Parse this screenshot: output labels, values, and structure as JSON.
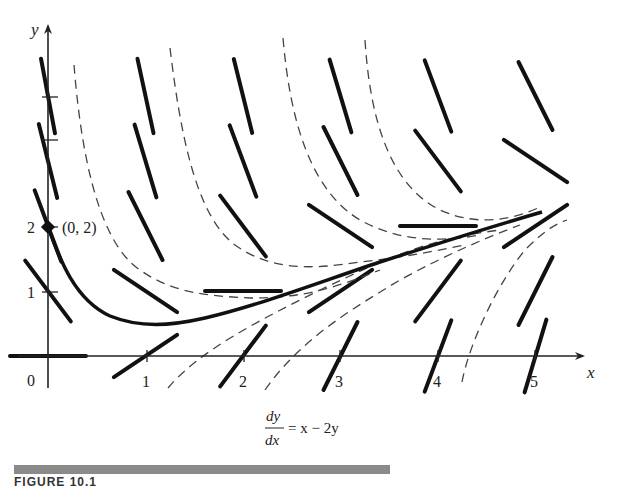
{
  "chart_data": {
    "type": "line",
    "title": "",
    "subtitle": "",
    "equation": {
      "numerator": "dy",
      "denominator": "dx",
      "rhs": "= x − 2y"
    },
    "xlabel": "x",
    "ylabel": "y",
    "origin_label": "0",
    "x_ticks": [
      "1",
      "2",
      "3",
      "4",
      "5"
    ],
    "y_ticks": [
      "1",
      "2"
    ],
    "xlim": [
      0,
      5.5
    ],
    "ylim": [
      -0.4,
      4.9
    ],
    "grid": false,
    "legend": null,
    "annotations": [
      {
        "text": "(0, 2)",
        "x": 0,
        "y": 2,
        "marker": "filled-diamond"
      }
    ],
    "series": [
      {
        "name": "solution through (0, 2)",
        "style": "solid-thick",
        "x": [
          0,
          0.1,
          0.2,
          0.3,
          0.5,
          0.75,
          1.0,
          1.25,
          1.5,
          2.0,
          2.5,
          3.0,
          3.5,
          4.0,
          4.5,
          5.0
        ],
        "y": [
          2.0,
          1.56,
          1.22,
          0.97,
          0.66,
          0.51,
          0.48,
          0.5,
          0.55,
          0.7,
          0.87,
          1.05,
          1.25,
          1.45,
          1.62,
          2.19
        ]
      }
    ],
    "other_solution_curves": [
      {
        "style": "dashed",
        "description": "upper family, steep decreasing then flattening toward slope 1/2 line"
      },
      {
        "style": "dashed",
        "description": "lower family, rising from below x-axis toward asymptote"
      }
    ],
    "slope_field": {
      "equation": "dy/dx = x - 2y",
      "sample_points": [
        [
          0,
          0
        ],
        [
          1,
          0
        ],
        [
          2,
          0
        ],
        [
          3,
          0
        ],
        [
          4,
          0
        ],
        [
          5,
          0
        ],
        [
          0,
          1
        ],
        [
          1,
          1
        ],
        [
          2,
          1
        ],
        [
          3,
          1
        ],
        [
          4,
          1
        ],
        [
          5,
          1
        ],
        [
          0,
          2
        ],
        [
          1,
          2
        ],
        [
          2,
          2
        ],
        [
          3,
          2
        ],
        [
          4,
          2
        ],
        [
          5,
          2
        ],
        [
          0,
          3
        ],
        [
          1,
          3
        ],
        [
          2,
          3
        ],
        [
          3,
          3
        ],
        [
          4,
          3
        ],
        [
          5,
          3
        ],
        [
          0,
          4
        ],
        [
          1,
          4
        ],
        [
          2,
          4
        ],
        [
          3,
          4
        ],
        [
          4,
          4
        ],
        [
          5,
          4
        ]
      ]
    }
  },
  "figure": {
    "caption_text": "FIGURE 10.1"
  }
}
